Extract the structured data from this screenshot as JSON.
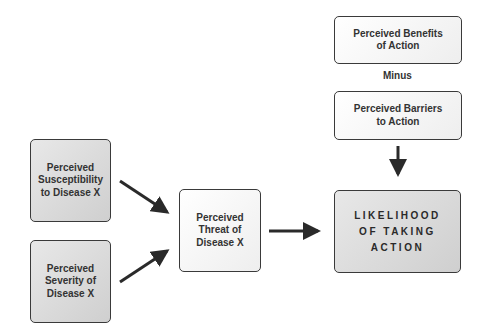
{
  "diagram": {
    "type": "health-belief-model",
    "nodes": {
      "susceptibility": "Perceived\nSusceptibility\nto Disease X",
      "severity": "Perceived\nSeverity of\nDisease X",
      "threat": "Perceived\nThreat of\nDisease X",
      "benefits": "Perceived Benefits\nof Action",
      "minus": "Minus",
      "barriers": "Perceived Barriers\nto Action",
      "likelihood": "LIKELIHOOD\nOF TAKING\nACTION"
    },
    "edges": [
      {
        "from": "susceptibility",
        "to": "threat"
      },
      {
        "from": "severity",
        "to": "threat"
      },
      {
        "from": "threat",
        "to": "likelihood"
      },
      {
        "from": "barriers",
        "to": "likelihood"
      }
    ]
  }
}
